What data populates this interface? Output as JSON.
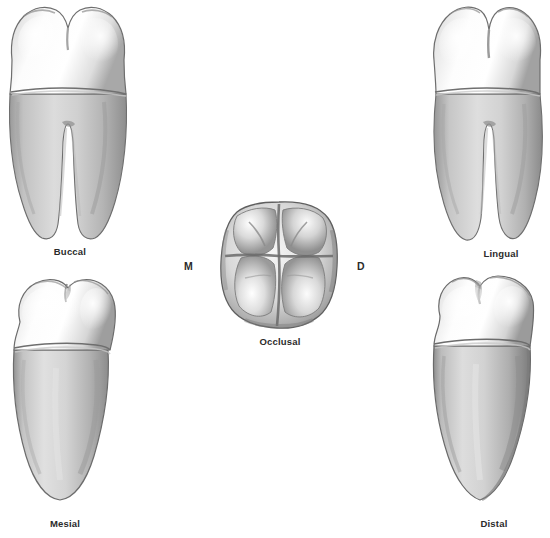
{
  "figure": {
    "background_color": "#ffffff",
    "label_color": "#2b2b2b",
    "views": [
      {
        "id": "buccal",
        "caption": "Buccal",
        "position": "top-left",
        "crown_cusps": 2,
        "roots": 2
      },
      {
        "id": "lingual",
        "caption": "Lingual",
        "position": "top-right",
        "crown_cusps": 2,
        "roots": 2
      },
      {
        "id": "occlusal",
        "caption": "Occlusal",
        "position": "center",
        "crown_cusps": 4,
        "roots": 0
      },
      {
        "id": "mesial",
        "caption": "Mesial",
        "position": "bottom-left",
        "crown_cusps": 2,
        "roots": 1
      },
      {
        "id": "distal",
        "caption": "Distal",
        "position": "bottom-right",
        "crown_cusps": 2,
        "roots": 1
      }
    ],
    "orientation_letters": {
      "mesial_letter": "M",
      "distal_letter": "D"
    }
  }
}
